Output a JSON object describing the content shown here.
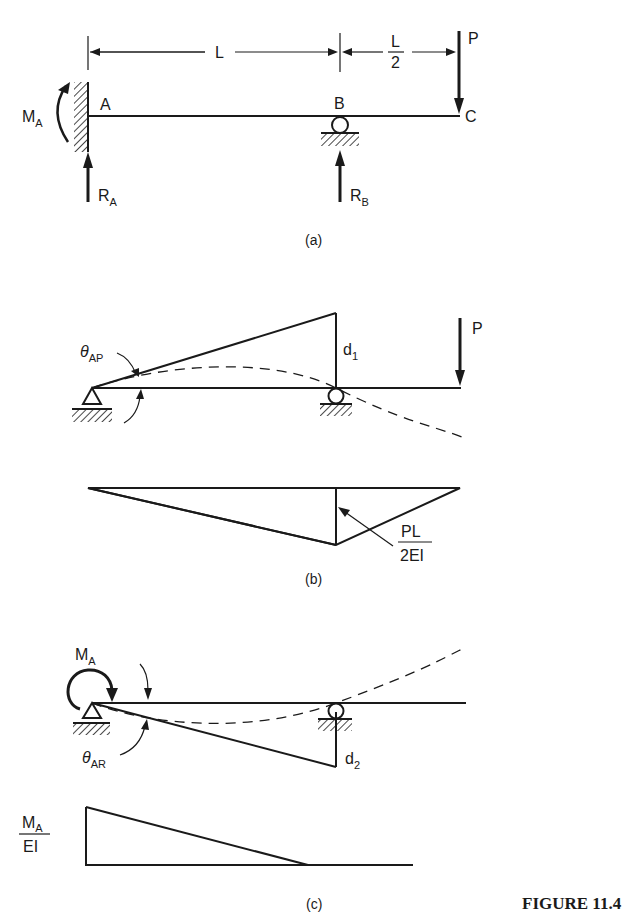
{
  "figure": {
    "title": "FIGURE 11.4",
    "panels": {
      "a": {
        "caption": "(a)",
        "dimension_L": "L",
        "dimension_half_num": "L",
        "dimension_half_den": "2",
        "point_A": "A",
        "point_B": "B",
        "point_C": "C",
        "load_P": "P",
        "moment_main": "M",
        "moment_sub": "A",
        "reaction_A_main": "R",
        "reaction_A_sub": "A",
        "reaction_B_main": "R",
        "reaction_B_sub": "B"
      },
      "b": {
        "caption": "(b)",
        "theta_main": "θ",
        "theta_sub": "AP",
        "deflection_main": "d",
        "deflection_sub": "1",
        "load_P": "P",
        "moment_num": "PL",
        "moment_den": "2EI"
      },
      "c": {
        "caption": "(c)",
        "moment_main": "M",
        "moment_sub": "A",
        "theta_main": "θ",
        "theta_sub": "AR",
        "deflection_main": "d",
        "deflection_sub": "2",
        "diagram_num_main": "M",
        "diagram_num_sub": "A",
        "diagram_den": "EI"
      }
    }
  }
}
